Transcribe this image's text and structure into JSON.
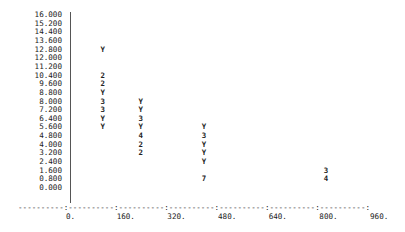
{
  "chart_data": {
    "type": "scatter",
    "style": "character-plot",
    "title": "",
    "xlabel": "",
    "ylabel": "",
    "xlim": [
      0,
      960
    ],
    "ylim": [
      0,
      16
    ],
    "y_ticks": [
      "16.000",
      "15.200",
      "14.400",
      "13.600",
      "12.800",
      "12.000",
      "11.200",
      "10.400",
      "9.600",
      "8.800",
      "8.000",
      "7.200",
      "6.400",
      "5.600",
      "4.800",
      "4.000",
      "3.200",
      "2.400",
      "1.600",
      "0.800",
      "0.000"
    ],
    "x_ticks": [
      "0.",
      "160.",
      "320.",
      "480.",
      "640.",
      "800.",
      "960."
    ],
    "x_axis_rule": "----------:----------:----------:----------:----------:----------:----------:",
    "points": [
      {
        "x": 100,
        "y": 12.8,
        "symbol": "Y"
      },
      {
        "x": 100,
        "y": 10.4,
        "symbol": "2"
      },
      {
        "x": 100,
        "y": 9.6,
        "symbol": "2"
      },
      {
        "x": 100,
        "y": 8.8,
        "symbol": "Y"
      },
      {
        "x": 100,
        "y": 8.0,
        "symbol": "3"
      },
      {
        "x": 100,
        "y": 7.2,
        "symbol": "3"
      },
      {
        "x": 100,
        "y": 6.4,
        "symbol": "Y"
      },
      {
        "x": 100,
        "y": 5.6,
        "symbol": "Y"
      },
      {
        "x": 220,
        "y": 8.0,
        "symbol": "Y"
      },
      {
        "x": 220,
        "y": 7.2,
        "symbol": "Y"
      },
      {
        "x": 220,
        "y": 6.4,
        "symbol": "3"
      },
      {
        "x": 220,
        "y": 5.6,
        "symbol": "Y"
      },
      {
        "x": 220,
        "y": 4.8,
        "symbol": "4"
      },
      {
        "x": 220,
        "y": 4.0,
        "symbol": "2"
      },
      {
        "x": 220,
        "y": 3.2,
        "symbol": "2"
      },
      {
        "x": 420,
        "y": 5.6,
        "symbol": "Y"
      },
      {
        "x": 420,
        "y": 4.8,
        "symbol": "3"
      },
      {
        "x": 420,
        "y": 4.0,
        "symbol": "Y"
      },
      {
        "x": 420,
        "y": 3.2,
        "symbol": "Y"
      },
      {
        "x": 420,
        "y": 2.4,
        "symbol": "Y"
      },
      {
        "x": 420,
        "y": 0.8,
        "symbol": "7"
      },
      {
        "x": 805,
        "y": 1.6,
        "symbol": "3"
      },
      {
        "x": 805,
        "y": 0.8,
        "symbol": "4"
      }
    ]
  }
}
